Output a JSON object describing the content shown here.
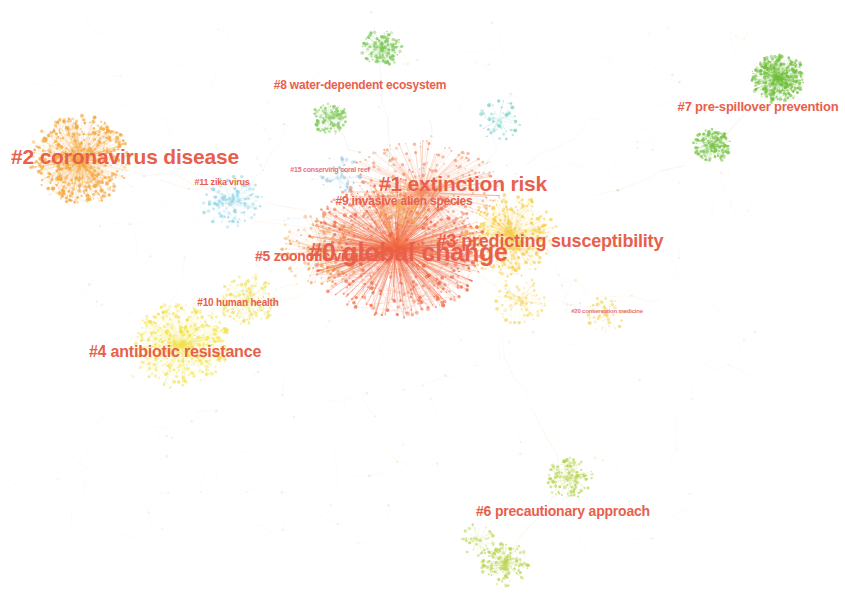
{
  "visualization": {
    "type": "co-citation-cluster-network",
    "background_color": "#ffffff",
    "width": 845,
    "height": 595,
    "label_color_primary": "#e8604c",
    "label_color_secondary": "#e87a66"
  },
  "clusters": [
    {
      "id": "0",
      "label": "#0 global change",
      "x": 408,
      "y": 252,
      "font_size": 25,
      "color": "#e8604c",
      "node_color": "#f0603c",
      "blob_x": 395,
      "blob_y": 245,
      "blob_r": 78,
      "density": "very-high"
    },
    {
      "id": "1",
      "label": "#1 extinction risk",
      "x": 463,
      "y": 184,
      "font_size": 21,
      "color": "#e8604c",
      "node_color": "#f4926a",
      "blob_x": 420,
      "blob_y": 190,
      "blob_r": 62,
      "density": "high"
    },
    {
      "id": "2",
      "label": "#2 coronavirus disease",
      "x": 125,
      "y": 157,
      "font_size": 21,
      "color": "#e8604c",
      "node_color": "#f5a63c",
      "blob_x": 80,
      "blob_y": 160,
      "blob_r": 58,
      "density": "high"
    },
    {
      "id": "3",
      "label": "#3 predicting susceptibility",
      "x": 550,
      "y": 241,
      "font_size": 18,
      "color": "#e8604c",
      "node_color": "#f7c948",
      "blob_x": 520,
      "blob_y": 235,
      "blob_r": 55,
      "density": "medium"
    },
    {
      "id": "4",
      "label": "#4 antibiotic resistance",
      "x": 175,
      "y": 352,
      "font_size": 16,
      "color": "#e8604c",
      "node_color": "#f2e04a",
      "blob_x": 180,
      "blob_y": 345,
      "blob_r": 52,
      "density": "medium"
    },
    {
      "id": "5",
      "label": "#5 zoonotic viruses",
      "x": 318,
      "y": 256,
      "font_size": 14,
      "color": "#e8604c",
      "node_color": "#f0a860",
      "blob_x": 320,
      "blob_y": 250,
      "blob_r": 42,
      "density": "medium"
    },
    {
      "id": "6",
      "label": "#6 precautionary approach",
      "x": 563,
      "y": 511,
      "font_size": 14,
      "color": "#e8604c",
      "node_color": "#b8d64a",
      "blob_x": 545,
      "blob_y": 520,
      "blob_r": 60,
      "density": "low"
    },
    {
      "id": "7",
      "label": "#7 pre-spillover prevention",
      "x": 758,
      "y": 106,
      "font_size": 13,
      "color": "#e8604c",
      "node_color": "#7dc242",
      "blob_x": 770,
      "blob_y": 85,
      "blob_r": 30,
      "density": "medium"
    },
    {
      "id": "8",
      "label": "#8 water-dependent ecosystem",
      "x": 360,
      "y": 85,
      "font_size": 12,
      "color": "#e8604c",
      "node_color": "#8ecb5a",
      "blob_x": 378,
      "blob_y": 50,
      "blob_r": 28,
      "density": "low"
    },
    {
      "id": "9",
      "label": "#9 invasive alien species",
      "x": 404,
      "y": 201,
      "font_size": 12,
      "color": "#e8604c",
      "node_color": "#f3b05a",
      "blob_x": 400,
      "blob_y": 205,
      "blob_r": 30,
      "density": "medium"
    },
    {
      "id": "10",
      "label": "#10 human health",
      "x": 238,
      "y": 302,
      "font_size": 10,
      "color": "#e8604c",
      "node_color": "#f0e060",
      "blob_x": 245,
      "blob_y": 300,
      "blob_r": 30,
      "density": "low"
    },
    {
      "id": "11",
      "label": "#11 zika virus",
      "x": 222,
      "y": 182,
      "font_size": 9,
      "color": "#e8604c",
      "node_color": "#8fd4e8",
      "blob_x": 232,
      "blob_y": 200,
      "blob_r": 32,
      "density": "low"
    },
    {
      "id": "15",
      "label": "#15 conserving coral reef",
      "x": 330,
      "y": 169,
      "font_size": 7,
      "color": "#e8707c",
      "node_color": "#9fc8e0",
      "blob_x": 338,
      "blob_y": 178,
      "blob_r": 24,
      "density": "low"
    },
    {
      "id": "20",
      "label": "#20 conservation medicine",
      "x": 607,
      "y": 311,
      "font_size": 6,
      "color": "#e8707c",
      "node_color": "#f0d860",
      "blob_x": 607,
      "blob_y": 315,
      "blob_r": 20,
      "density": "low"
    }
  ],
  "satellite_blobs": [
    {
      "name": "top-green-upper",
      "x": 382,
      "y": 48,
      "r": 20,
      "color": "#7ec85a",
      "n": 70
    },
    {
      "name": "top-green-lower",
      "x": 330,
      "y": 118,
      "r": 18,
      "color": "#86cc62",
      "n": 55
    },
    {
      "name": "top-teal-right",
      "x": 500,
      "y": 120,
      "r": 22,
      "color": "#7fd0c8",
      "n": 45
    },
    {
      "name": "green-cluster-main",
      "x": 778,
      "y": 78,
      "r": 26,
      "color": "#6fbf3a",
      "n": 150
    },
    {
      "name": "green-cluster-lower",
      "x": 712,
      "y": 145,
      "r": 18,
      "color": "#79c448",
      "n": 70
    },
    {
      "name": "bottom-green-upper",
      "x": 570,
      "y": 478,
      "r": 22,
      "color": "#b6d44e",
      "n": 60
    },
    {
      "name": "bottom-green-lower",
      "x": 505,
      "y": 565,
      "r": 24,
      "color": "#b9d552",
      "n": 70
    },
    {
      "name": "bottom-green-left",
      "x": 478,
      "y": 540,
      "r": 18,
      "color": "#c0d860",
      "n": 40
    },
    {
      "name": "cyan-mid-left",
      "x": 232,
      "y": 202,
      "r": 28,
      "color": "#9ad8ea",
      "n": 55
    },
    {
      "name": "pale-yellow-lower-left",
      "x": 182,
      "y": 344,
      "r": 46,
      "color": "#f4ea62",
      "n": 220
    },
    {
      "name": "pale-yellow-mid",
      "x": 248,
      "y": 300,
      "r": 28,
      "color": "#f2e878",
      "n": 70
    },
    {
      "name": "yellow-right-core",
      "x": 508,
      "y": 232,
      "r": 40,
      "color": "#f8cf4e",
      "n": 180
    },
    {
      "name": "yellow-right-low",
      "x": 520,
      "y": 300,
      "r": 26,
      "color": "#f6da68",
      "n": 70
    },
    {
      "name": "orange-left-core",
      "x": 80,
      "y": 160,
      "r": 48,
      "color": "#f5a63c",
      "n": 300
    }
  ],
  "label_list": [
    "#0 global change",
    "#1 extinction risk",
    "#2 coronavirus disease",
    "#3 predicting susceptibility",
    "#4 antibiotic resistance",
    "#5 zoonotic viruses",
    "#6 precautionary approach",
    "#7 pre-spillover prevention",
    "#8 water-dependent ecosystem",
    "#9 invasive alien species",
    "#10 human health",
    "#11 zika virus",
    "#15 conserving coral reef",
    "#20 conservation medicine"
  ]
}
